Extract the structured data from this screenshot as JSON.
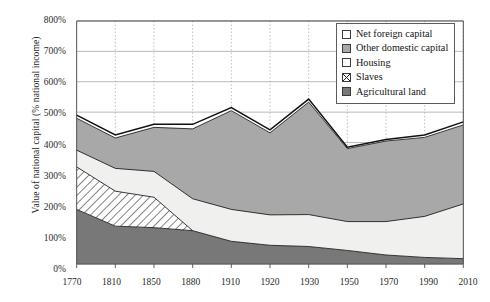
{
  "chart_data": {
    "type": "area",
    "title": "",
    "subtitle": "",
    "xlabel": "",
    "ylabel": "Value of national capital (% national income)",
    "stacked": true,
    "grid": true,
    "legend_position": "top-right",
    "xlim": [
      1770,
      2010
    ],
    "ylim": [
      0,
      800
    ],
    "ytick_values": [
      0,
      100,
      200,
      300,
      400,
      500,
      600,
      700,
      800
    ],
    "ytick_labels": [
      "0%",
      "100%",
      "200%",
      "300%",
      "400%",
      "500%",
      "600%",
      "700%",
      "800%"
    ],
    "categories": [
      1770,
      1810,
      1850,
      1880,
      1910,
      1920,
      1930,
      1950,
      1970,
      1990,
      2010
    ],
    "xtick_labels": [
      "1770",
      "1810",
      "1850",
      "1880",
      "1910",
      "1920",
      "1930",
      "1950",
      "1970",
      "1990",
      "2010"
    ],
    "series": [
      {
        "name": "Agricultural land",
        "fill": "#787878",
        "pattern": "solid",
        "values": [
          180,
          125,
          120,
          110,
          75,
          62,
          58,
          45,
          30,
          22,
          18
        ]
      },
      {
        "name": "Slaves",
        "fill": "#ffffff",
        "pattern": "diagonal-hatch",
        "values": [
          140,
          115,
          100,
          0,
          0,
          0,
          0,
          0,
          0,
          0,
          0
        ]
      },
      {
        "name": "Housing",
        "fill": "#f0f0ee",
        "pattern": "solid",
        "values": [
          55,
          75,
          85,
          105,
          105,
          100,
          105,
          95,
          110,
          135,
          180
        ]
      },
      {
        "name": "Other domestic capital",
        "fill": "#a8a8a8",
        "pattern": "solid",
        "values": [
          105,
          100,
          145,
          230,
          325,
          270,
          370,
          240,
          265,
          260,
          260
        ]
      },
      {
        "name": "Net foreign capital",
        "fill": "#ffffff",
        "pattern": "solid",
        "values": [
          10,
          10,
          10,
          15,
          10,
          10,
          10,
          5,
          5,
          8,
          10
        ]
      }
    ],
    "totals": [
      490,
      425,
      460,
      460,
      515,
      442,
      543,
      385,
      410,
      425,
      468
    ]
  },
  "legend": {
    "items": [
      {
        "label": "Net foreign capital",
        "swatch": "white"
      },
      {
        "label": "Other domestic capital",
        "swatch": "mid-gray"
      },
      {
        "label": "Housing",
        "swatch": "white"
      },
      {
        "label": "Slaves",
        "swatch": "hatched"
      },
      {
        "label": "Agricultural land",
        "swatch": "dark-gray"
      }
    ]
  },
  "colors": {
    "agricultural_land": "#787878",
    "other_domestic_capital": "#a8a8a8",
    "housing": "#f0f0ee",
    "net_foreign_capital": "#ffffff",
    "slaves_hatch": "#ffffff",
    "axis": "#4d4d4d",
    "grid": "#9a9a9a",
    "outline": "#111111"
  }
}
